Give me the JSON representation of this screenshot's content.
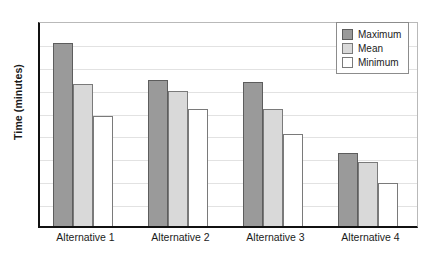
{
  "chart_data": {
    "type": "bar",
    "title": "",
    "xlabel": "",
    "ylabel": "Time (minutes)",
    "categories": [
      "Alternative 1",
      "Alternative 2",
      "Alternative 3",
      "Alternative 4"
    ],
    "series": [
      {
        "name": "Maximum",
        "color": "#9a9a9a",
        "values": [
          8.0,
          6.4,
          6.3,
          3.2
        ]
      },
      {
        "name": "Mean",
        "color": "#d9d9d9",
        "values": [
          6.2,
          5.9,
          5.1,
          2.8
        ]
      },
      {
        "name": "Minimum",
        "color": "#ffffff",
        "values": [
          4.8,
          5.1,
          4.0,
          1.9
        ]
      }
    ],
    "ylim": [
      0,
      9
    ],
    "ytick_labels": [],
    "grid": true,
    "gridline_count": 8,
    "legend_position": "top-right"
  },
  "legend": {
    "entries": [
      {
        "label": "Maximum",
        "swatch": "maximum"
      },
      {
        "label": "Mean",
        "swatch": "mean"
      },
      {
        "label": "Minimum",
        "swatch": "minimum"
      }
    ]
  },
  "axes": {
    "y_title": "Time (minutes)",
    "x_tick_labels": [
      "Alternative 1",
      "Alternative 2",
      "Alternative 3",
      "Alternative 4"
    ]
  }
}
